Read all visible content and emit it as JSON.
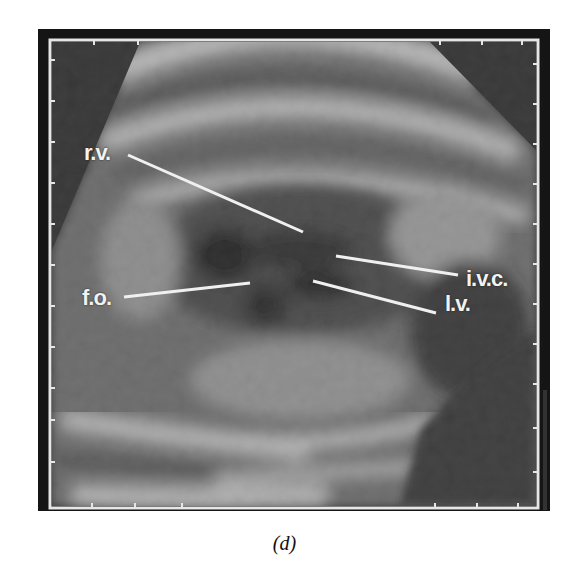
{
  "figure": {
    "caption": "(d)",
    "labels": [
      {
        "id": "rv",
        "text": "r.v.",
        "x": 84,
        "y": 140,
        "line": [
          128,
          155,
          303,
          232
        ]
      },
      {
        "id": "ivc",
        "text": "i.v.c.",
        "x": 466,
        "y": 266,
        "line": [
          336,
          256,
          458,
          275
        ]
      },
      {
        "id": "lv",
        "text": "l.v.",
        "x": 445,
        "y": 290,
        "line": [
          313,
          281,
          436,
          313
        ]
      },
      {
        "id": "fo",
        "text": "f.o.",
        "x": 82,
        "y": 284,
        "line": [
          124,
          297,
          250,
          283
        ]
      }
    ],
    "colors": {
      "background": "#ffffff",
      "frame": "#e8e8e8",
      "scan_dark": "#1a1a1a",
      "tissue_light": "#cfcfcf"
    }
  }
}
